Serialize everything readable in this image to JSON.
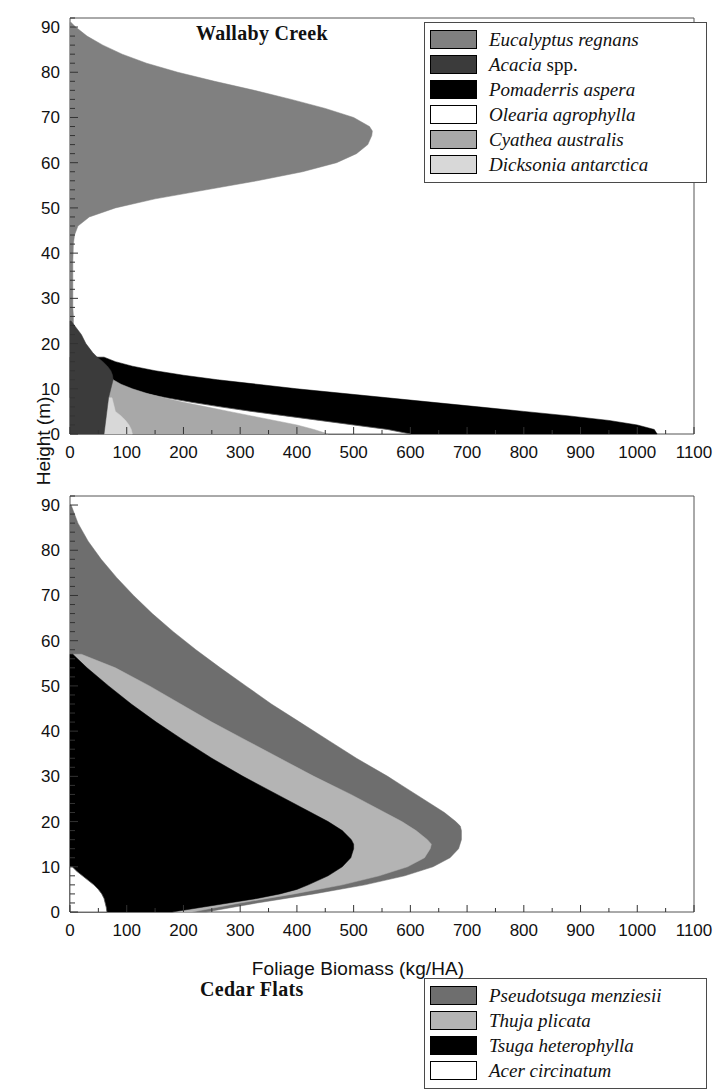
{
  "figure": {
    "axis_x_title": "Foliage Biomass (kg/HA)",
    "axis_y_title": "Height (m)"
  },
  "panels": [
    {
      "id": "wallaby-creek",
      "title": "Wallaby Creek",
      "legend": [
        {
          "label": "Eucalyptus regnans",
          "roman_suffix": "",
          "color": "#808080"
        },
        {
          "label": "Acacia",
          "roman_suffix": " spp.",
          "color": "#3b3b3b"
        },
        {
          "label": "Pomaderris aspera",
          "roman_suffix": "",
          "color": "#000000"
        },
        {
          "label": "Olearia agrophylla",
          "roman_suffix": "",
          "color": "#ffffff"
        },
        {
          "label": "Cyathea australis",
          "roman_suffix": "",
          "color": "#a8a8a8"
        },
        {
          "label": "Dicksonia antarctica",
          "roman_suffix": "",
          "color": "#d8d8d8"
        }
      ]
    },
    {
      "id": "cedar-flats",
      "title": "Cedar Flats",
      "legend": [
        {
          "label": "Pseudotsuga menziesii",
          "roman_suffix": "",
          "color": "#6e6e6e"
        },
        {
          "label": "Thuja plicata",
          "roman_suffix": "",
          "color": "#b4b4b4"
        },
        {
          "label": "Tsuga heterophylla",
          "roman_suffix": "",
          "color": "#000000"
        },
        {
          "label": "Acer circinatum",
          "roman_suffix": "",
          "color": "#ffffff"
        }
      ]
    }
  ],
  "chart_data": [
    {
      "type": "area",
      "title": "Wallaby Creek",
      "xlabel": "Foliage Biomass (kg/HA)",
      "ylabel": "Height (m)",
      "xlim": [
        0,
        1100
      ],
      "ylim": [
        0,
        92
      ],
      "xticks": [
        0,
        100,
        200,
        300,
        400,
        500,
        600,
        700,
        800,
        900,
        1000,
        1100
      ],
      "yticks": [
        0,
        10,
        20,
        30,
        40,
        50,
        60,
        70,
        80,
        90
      ],
      "minor_tick_interval": 2,
      "grid": false,
      "legend_position": "top-right",
      "orientation": "horizontal-profile",
      "note": "Cumulative stacked foliage-biomass profile vs canopy height; x = biomass, y = height",
      "series": [
        {
          "name": "Eucalyptus regnans",
          "color": "#808080",
          "heights": [
            0,
            2,
            4,
            6,
            8,
            10,
            12,
            14,
            15,
            16,
            17,
            18,
            19,
            20,
            22,
            24,
            26,
            28,
            30,
            34,
            38,
            42,
            44,
            46,
            48,
            50,
            52,
            54,
            56,
            58,
            60,
            62,
            64,
            66,
            67,
            68,
            70,
            72,
            74,
            76,
            78,
            80,
            82,
            84,
            86,
            88,
            90,
            91
          ],
          "values": [
            2,
            3,
            4,
            5,
            6,
            8,
            10,
            14,
            20,
            30,
            26,
            18,
            12,
            9,
            7,
            6,
            6,
            5,
            5,
            5,
            5,
            6,
            8,
            14,
            34,
            80,
            150,
            240,
            330,
            410,
            470,
            505,
            525,
            532,
            533,
            528,
            500,
            450,
            390,
            325,
            255,
            190,
            135,
            92,
            58,
            30,
            10,
            2
          ]
        },
        {
          "name": "Acacia spp.",
          "color": "#3b3b3b",
          "heights": [
            0,
            2,
            4,
            6,
            8,
            10,
            11,
            12,
            13,
            14,
            15,
            16,
            17,
            18,
            19,
            20,
            21,
            22,
            23,
            24,
            25
          ],
          "values": [
            60,
            62,
            64,
            66,
            68,
            72,
            74,
            76,
            75,
            72,
            66,
            58,
            48,
            40,
            34,
            28,
            24,
            20,
            14,
            8,
            2
          ]
        },
        {
          "name": "Pomaderris aspera",
          "color": "#000000",
          "heights": [
            0,
            1,
            2,
            3,
            4,
            5,
            6,
            7,
            8,
            9,
            10,
            11,
            12,
            13,
            14,
            15,
            16,
            17
          ],
          "values": [
            1035,
            1030,
            1000,
            950,
            880,
            800,
            720,
            640,
            560,
            480,
            400,
            330,
            260,
            200,
            150,
            110,
            80,
            60
          ]
        },
        {
          "name": "Olearia agrophylla",
          "color": "#ffffff",
          "heights": [
            0,
            1,
            2,
            3,
            4,
            5,
            6,
            7,
            8,
            9,
            10,
            11,
            12,
            13
          ],
          "values": [
            600,
            560,
            500,
            440,
            380,
            320,
            265,
            215,
            170,
            130,
            100,
            80,
            66,
            60
          ]
        },
        {
          "name": "Cyathea australis",
          "color": "#a8a8a8",
          "heights": [
            0,
            1,
            2,
            3,
            4,
            5,
            6,
            7,
            8,
            9,
            10,
            11,
            12,
            13
          ],
          "values": [
            455,
            430,
            400,
            360,
            320,
            280,
            240,
            200,
            165,
            135,
            110,
            90,
            76,
            70
          ]
        },
        {
          "name": "Dicksonia antarctica",
          "color": "#d8d8d8",
          "heights": [
            0,
            1,
            2,
            3,
            4,
            5,
            6,
            7,
            8
          ],
          "values": [
            110,
            108,
            104,
            98,
            90,
            80,
            78,
            76,
            74
          ]
        }
      ]
    },
    {
      "type": "area",
      "title": "Cedar Flats",
      "xlabel": "Foliage Biomass (kg/HA)",
      "ylabel": "Height (m)",
      "xlim": [
        0,
        1100
      ],
      "ylim": [
        0,
        92
      ],
      "xticks": [
        0,
        100,
        200,
        300,
        400,
        500,
        600,
        700,
        800,
        900,
        1000,
        1100
      ],
      "yticks": [
        0,
        10,
        20,
        30,
        40,
        50,
        60,
        70,
        80,
        90
      ],
      "minor_tick_interval": 2,
      "grid": false,
      "legend_position": "top-right",
      "orientation": "horizontal-profile",
      "note": "Cumulative stacked foliage-biomass profile vs canopy height; x = biomass, y = height",
      "series": [
        {
          "name": "Pseudotsuga menziesii",
          "color": "#6e6e6e",
          "heights": [
            0,
            2,
            4,
            6,
            8,
            10,
            12,
            14,
            16,
            18,
            19,
            20,
            22,
            24,
            26,
            28,
            30,
            34,
            38,
            42,
            46,
            50,
            54,
            58,
            62,
            66,
            70,
            74,
            78,
            82,
            86,
            90
          ],
          "values": [
            240,
            330,
            430,
            520,
            590,
            640,
            670,
            685,
            690,
            690,
            688,
            680,
            660,
            635,
            610,
            585,
            560,
            505,
            455,
            405,
            355,
            310,
            265,
            222,
            182,
            145,
            112,
            82,
            55,
            32,
            14,
            2
          ]
        },
        {
          "name": "Thuja plicata",
          "color": "#b4b4b4",
          "heights": [
            0,
            2,
            4,
            6,
            8,
            10,
            12,
            14,
            15,
            16,
            18,
            20,
            22,
            24,
            26,
            30,
            34,
            38,
            42,
            46,
            50,
            54,
            57
          ],
          "values": [
            215,
            300,
            395,
            480,
            545,
            595,
            625,
            635,
            637,
            630,
            610,
            585,
            555,
            525,
            495,
            430,
            370,
            310,
            250,
            195,
            140,
            80,
            20
          ]
        },
        {
          "name": "Tsuga heterophylla",
          "color": "#000000",
          "heights": [
            0,
            1,
            2,
            3,
            4,
            5,
            6,
            8,
            10,
            12,
            14,
            15,
            16,
            18,
            20,
            22,
            24,
            26,
            30,
            34,
            38,
            42,
            46,
            50,
            54,
            57
          ],
          "values": [
            180,
            230,
            280,
            330,
            370,
            400,
            420,
            455,
            480,
            495,
            500,
            500,
            496,
            480,
            455,
            425,
            395,
            365,
            305,
            250,
            200,
            152,
            108,
            68,
            30,
            5
          ]
        },
        {
          "name": "Acer circinatum",
          "color": "#ffffff",
          "heights": [
            0,
            1,
            2,
            3,
            4,
            5,
            6,
            7,
            8,
            9,
            10
          ],
          "values": [
            65,
            64,
            62,
            60,
            56,
            50,
            42,
            32,
            22,
            12,
            4
          ]
        }
      ]
    }
  ]
}
